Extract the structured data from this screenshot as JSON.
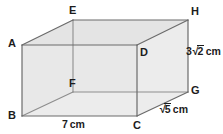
{
  "figure": {
    "type": "cuboid-net-diagram",
    "canvas": {
      "width": 223,
      "height": 134,
      "background": "#ffffff"
    },
    "style": {
      "edge_color": "#6b6b6b",
      "hidden_edge_color": "#8a8a8a",
      "face_fill": "#e6e6e6",
      "face_fill_light": "#ececec",
      "label_color": "#1c1c1c",
      "edge_width": 1.1
    },
    "vertices": [
      {
        "name": "A",
        "label": "A",
        "x": 22,
        "y": 45,
        "label_x": 8,
        "label_y": 38
      },
      {
        "name": "B",
        "label": "B",
        "x": 22,
        "y": 116,
        "label_x": 8,
        "label_y": 111
      },
      {
        "name": "C",
        "label": "C",
        "x": 137,
        "y": 116,
        "label_x": 134,
        "label_y": 120
      },
      {
        "name": "D",
        "label": "D",
        "x": 137,
        "y": 45,
        "label_x": 140,
        "label_y": 47
      },
      {
        "name": "E",
        "label": "E",
        "x": 73,
        "y": 20,
        "label_x": 69,
        "label_y": 5
      },
      {
        "name": "F",
        "label": "F",
        "x": 73,
        "y": 92,
        "label_x": 69,
        "label_y": 78
      },
      {
        "name": "G",
        "label": "G",
        "x": 188,
        "y": 92,
        "label_x": 192,
        "label_y": 86
      },
      {
        "name": "H",
        "label": "H",
        "x": 188,
        "y": 20,
        "label_x": 192,
        "label_y": 6
      }
    ],
    "dimensions": [
      {
        "name": "width-bc",
        "edge": "BC",
        "text": "7 cm",
        "number": "7",
        "has_radical": false,
        "radicand": "",
        "unit": "cm",
        "x": 62,
        "y": 120
      },
      {
        "name": "depth-cg",
        "edge": "CG",
        "text": "√5 cm",
        "number": "",
        "has_radical": true,
        "radicand": "5",
        "unit": "cm",
        "x": 160,
        "y": 104
      },
      {
        "name": "height-gh",
        "edge": "GH",
        "text": "3√2 cm",
        "number": "3",
        "has_radical": true,
        "radicand": "2",
        "unit": "cm",
        "x": 186,
        "y": 46
      }
    ]
  }
}
